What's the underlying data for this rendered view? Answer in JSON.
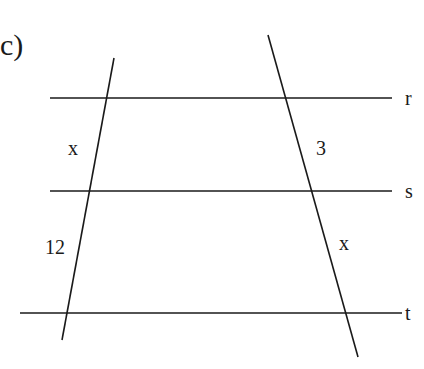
{
  "diagram": {
    "part_label": "c)",
    "parallel_lines": [
      {
        "name": "r",
        "label": "r"
      },
      {
        "name": "s",
        "label": "s"
      },
      {
        "name": "t",
        "label": "t"
      }
    ],
    "segment_labels": {
      "left_upper": "x",
      "left_lower": "12",
      "right_upper": "3",
      "right_lower": "x"
    },
    "colors": {
      "line": "#1a1a1a",
      "background": "#ffffff"
    }
  }
}
